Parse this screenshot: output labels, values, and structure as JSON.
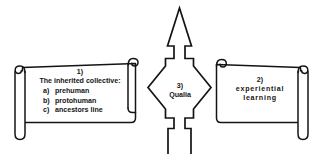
{
  "canvas": {
    "width": 323,
    "height": 154,
    "background": "#ffffff",
    "stroke": "#141414"
  },
  "diagram": {
    "type": "concept-diagram",
    "nodes": [
      {
        "id": "left-scroll",
        "shape": "scroll",
        "number": "1)",
        "heading": "The inherited collective:",
        "items": [
          {
            "label": "a)",
            "text": "prehuman"
          },
          {
            "label": "b)",
            "text": "protohuman"
          },
          {
            "label": "c)",
            "text": "ancestors line"
          }
        ]
      },
      {
        "id": "right-scroll",
        "shape": "scroll",
        "number": "2)",
        "lines": [
          "experiential",
          "learning"
        ]
      },
      {
        "id": "center-arrow",
        "shape": "four-way-arrow",
        "number": "3)",
        "label": "Qualia",
        "directions": [
          "up",
          "left",
          "right",
          "down"
        ]
      }
    ]
  },
  "icons": {
    "left_scroll": "scroll-icon",
    "right_scroll": "scroll-icon",
    "center": "four-way-arrow-icon",
    "curl_top_left": "scroll-curl-icon",
    "curl_top_right": "scroll-curl-icon"
  }
}
